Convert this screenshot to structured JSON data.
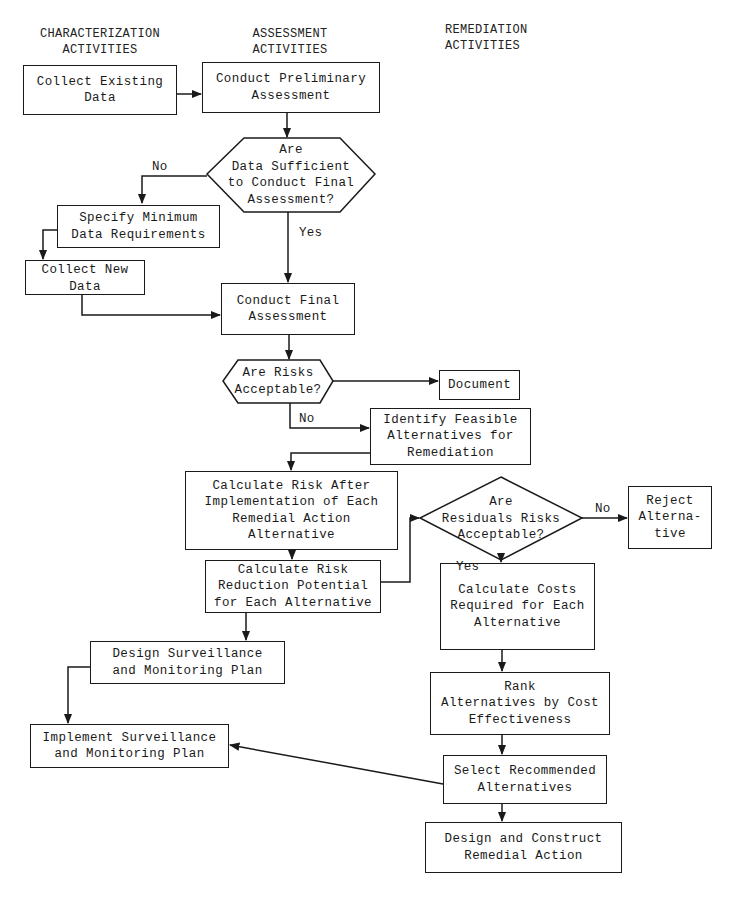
{
  "columns": {
    "characterization": "CHARACTERIZATION\nACTIVITIES",
    "assessment": "ASSESSMENT\nACTIVITIES",
    "remediation": "REMEDIATION\nACTIVITIES"
  },
  "nodes": {
    "collect_existing": "Collect Existing\nData",
    "conduct_preliminary": "Conduct Preliminary\nAssessment",
    "data_sufficient": "Are\nData Sufficient\nto Conduct Final\nAssessment?",
    "specify_minimum": "Specify Minimum\nData Requirements",
    "collect_new": "Collect New\nData",
    "conduct_final": "Conduct Final\nAssessment",
    "risks_acceptable": "Are Risks\nAcceptable?",
    "document": "Document",
    "identify_feasible": "Identify Feasible\nAlternatives for\nRemediation",
    "calc_risk_after": "Calculate Risk After\nImplementation of Each\nRemedial Action\nAlternative",
    "calc_risk_reduction": "Calculate Risk\nReduction Potential\nfor Each Alternative",
    "residual_risks": "Are\nResiduals Risks\nAcceptable?",
    "reject_alternative": "Reject\nAlterna-\ntive",
    "calc_costs": "Calculate Costs\nRequired for Each\nAlternative",
    "design_surveillance": "Design Surveillance\nand Monitoring Plan",
    "rank_alternatives": "Rank\nAlternatives by Cost\nEffectiveness",
    "implement_surveillance": "Implement Surveillance\nand Monitoring Plan",
    "select_recommended": "Select Recommended\nAlternatives",
    "design_construct": "Design and Construct\nRemedial Action"
  },
  "edge_labels": {
    "data_no": "No",
    "data_yes": "Yes",
    "risks_no": "No",
    "residual_no": "No",
    "residual_yes": "Yes"
  },
  "colors": {
    "ink": "#1a1a1a",
    "background": "#ffffff"
  }
}
